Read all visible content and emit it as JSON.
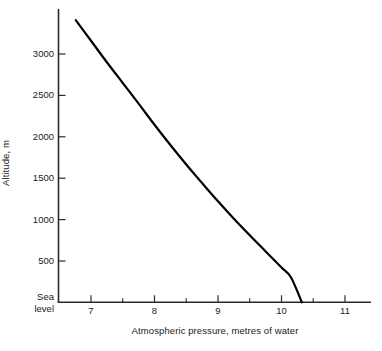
{
  "chart_data": {
    "type": "line",
    "title": "",
    "xlabel": "Atmospheric pressure, metres of water",
    "ylabel": "Altitude, m",
    "xlim": [
      6.62,
      11.46
    ],
    "ylim": [
      0,
      3450
    ],
    "grid": false,
    "legend": null,
    "x_ticks": [
      {
        "value": 7,
        "label": "7"
      },
      {
        "value": 8,
        "label": "8"
      },
      {
        "value": 9,
        "label": "9"
      },
      {
        "value": 10,
        "label": "10"
      },
      {
        "value": 11,
        "label": "11"
      }
    ],
    "x_minor_ticks": [
      7.5,
      8.5,
      9.5,
      10.5
    ],
    "y_ticks": [
      {
        "value": 0,
        "label": "Sea level"
      },
      {
        "value": 500,
        "label": "500"
      },
      {
        "value": 1000,
        "label": "1000"
      },
      {
        "value": 1500,
        "label": "1500"
      },
      {
        "value": 2000,
        "label": "2000"
      },
      {
        "value": 2500,
        "label": "2500"
      },
      {
        "value": 3000,
        "label": "3000"
      }
    ],
    "y_tick_labels_display": [
      "3000",
      "2500",
      "2000",
      "1500",
      "1000",
      "500",
      "Sea",
      "level"
    ],
    "series": [
      {
        "name": "Atmospheric pressure vs altitude",
        "color": "#000000",
        "line_width": 2.2,
        "points": [
          {
            "x": 6.76,
            "y": 3410
          },
          {
            "x": 7.0,
            "y": 3160
          },
          {
            "x": 7.25,
            "y": 2900
          },
          {
            "x": 7.5,
            "y": 2650
          },
          {
            "x": 7.75,
            "y": 2400
          },
          {
            "x": 8.0,
            "y": 2145
          },
          {
            "x": 8.25,
            "y": 1900
          },
          {
            "x": 8.5,
            "y": 1665
          },
          {
            "x": 8.75,
            "y": 1440
          },
          {
            "x": 9.0,
            "y": 1220
          },
          {
            "x": 9.25,
            "y": 1010
          },
          {
            "x": 9.5,
            "y": 810
          },
          {
            "x": 9.75,
            "y": 615
          },
          {
            "x": 10.0,
            "y": 420
          },
          {
            "x": 10.15,
            "y": 300
          },
          {
            "x": 10.32,
            "y": 0
          }
        ]
      }
    ]
  },
  "axes": {
    "y_axis_title": "Altitude, m",
    "x_axis_title": "Atmospheric pressure, metres of water",
    "sea_level_line_1": "Sea",
    "sea_level_line_2": "level"
  },
  "colors": {
    "curve": "#000000",
    "axis": "#2b2b2b",
    "text": "#1a1a1a",
    "background": "#ffffff"
  }
}
